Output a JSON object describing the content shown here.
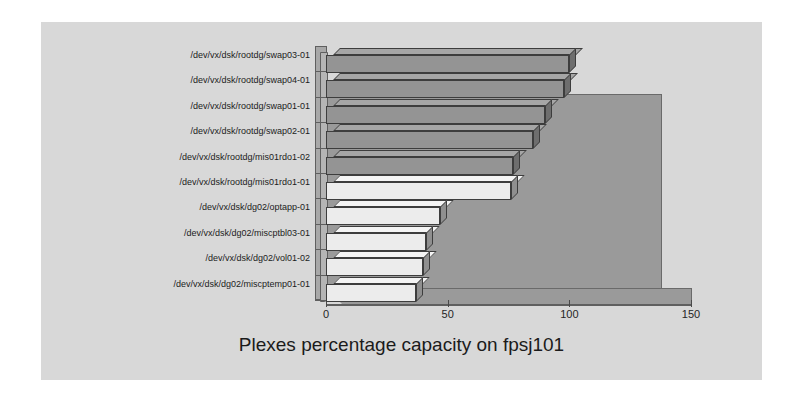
{
  "chart_data": {
    "type": "bar",
    "orientation": "horizontal",
    "title": "Plexes percentage capacity on fpsj101",
    "xlabel": "",
    "ylabel": "",
    "xlim": [
      0,
      150
    ],
    "xticks": [
      0,
      50,
      100,
      150
    ],
    "xtick_labels": [
      "0",
      "50",
      "100",
      "150"
    ],
    "grid": false,
    "legend": false,
    "three_d": true,
    "categories": [
      "/dev/vx/dsk/rootdg/swap03-01",
      "/dev/vx/dsk/rootdg/swap04-01",
      "/dev/vx/dsk/rootdg/swap01-01",
      "/dev/vx/dsk/rootdg/swap02-01",
      "/dev/vx/dsk/rootdg/mis01rdo1-02",
      "/dev/vx/dsk/rootdg/mis01rdo1-01",
      "/dev/vx/dsk/dg02/optapp-01",
      "/dev/vx/dsk/dg02/miscptbl03-01",
      "/dev/vx/dsk/dg02/vol01-02",
      "/dev/vx/dsk/dg02/miscptemp01-01"
    ],
    "values": [
      100,
      98,
      90,
      85,
      77,
      76,
      47,
      41,
      40,
      37
    ],
    "bar_shades": [
      "dark",
      "dark",
      "dark",
      "dark",
      "dark",
      "light",
      "light",
      "light",
      "light",
      "light"
    ]
  },
  "colors": {
    "panel_background": "#d8d8d8",
    "page_background": "#ffffff",
    "wall": "#9a9a9a",
    "bar_dark_front": "#949494",
    "bar_dark_top": "#a6a6a6",
    "bar_dark_side": "#6e6e6e",
    "bar_light_front": "#ececec",
    "bar_light_top": "#f4f4f4",
    "bar_light_side": "#8f8f8f",
    "axis": "#5f5f5f",
    "text": "#1b1b1b"
  }
}
